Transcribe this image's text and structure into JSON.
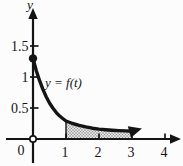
{
  "chart_data": {
    "type": "line",
    "title": "",
    "xlabel": "",
    "ylabel": "y",
    "origin_tick_label": "0",
    "x_ticks": [
      1,
      2,
      3,
      4
    ],
    "y_ticks": [
      0.5,
      1,
      1.5
    ],
    "x_range": [
      0,
      4.5
    ],
    "y_range": [
      0,
      2.1
    ],
    "grid": false,
    "legend": "none",
    "curve": {
      "label": "y = f(t)",
      "points": [
        [
          0,
          1.3
        ],
        [
          0.1,
          1.1
        ],
        [
          0.2,
          0.94
        ],
        [
          0.3,
          0.8
        ],
        [
          0.4,
          0.68
        ],
        [
          0.5,
          0.58
        ],
        [
          0.6,
          0.5
        ],
        [
          0.7,
          0.43
        ],
        [
          0.8,
          0.375
        ],
        [
          0.9,
          0.33
        ],
        [
          1.0,
          0.29
        ],
        [
          1.2,
          0.25
        ],
        [
          1.4,
          0.22
        ],
        [
          1.6,
          0.195
        ],
        [
          1.8,
          0.175
        ],
        [
          2.0,
          0.16
        ],
        [
          2.2,
          0.15
        ],
        [
          2.4,
          0.142
        ],
        [
          2.6,
          0.136
        ],
        [
          2.8,
          0.13
        ],
        [
          3.0,
          0.125
        ]
      ],
      "start_dot": [
        0,
        1.3
      ],
      "end_arrow_at": [
        3.3,
        0.17
      ]
    },
    "shaded_region": {
      "from": 1,
      "to": 3,
      "style": "stipple",
      "description": "area under y = f(t) between t = 1 and t = 3"
    },
    "origin_marker": "open-circle",
    "colors": {
      "ink": "#141414",
      "shade_base": "#e4e4e4",
      "shade_dot": "#7f7f7f",
      "background": "#fcfcfc"
    }
  }
}
